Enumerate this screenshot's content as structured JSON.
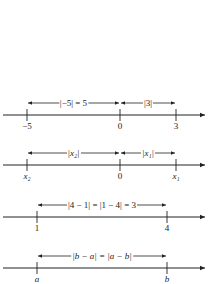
{
  "diagrams": [
    {
      "axis_y": 115,
      "arrow_y": 103,
      "ticks": [
        {
          "x": 27,
          "label": "−5"
        },
        {
          "x": 120,
          "label": "0"
        },
        {
          "x": 176,
          "label": "3"
        }
      ],
      "distances": [
        {
          "x1": 27,
          "x2": 120,
          "label": "|−5| = 5"
        },
        {
          "x1": 120,
          "x2": 176,
          "label": "|3|"
        }
      ]
    },
    {
      "axis_y": 165,
      "arrow_y": 153,
      "ticks": [
        {
          "x": 27,
          "label": "x₂"
        },
        {
          "x": 120,
          "label": "0"
        },
        {
          "x": 176,
          "label": "x₁"
        }
      ],
      "distances": [
        {
          "x1": 27,
          "x2": 120,
          "label": "|x₂|"
        },
        {
          "x1": 120,
          "x2": 176,
          "label": "|x₁|"
        }
      ]
    },
    {
      "axis_y": 217,
      "arrow_y": 205,
      "ticks": [
        {
          "x": 37,
          "label": "1"
        },
        {
          "x": 167,
          "label": "4"
        }
      ],
      "distances": [
        {
          "x1": 37,
          "x2": 167,
          "label": "|4 − 1| = |1 − 4| = 3"
        }
      ]
    },
    {
      "axis_y": 268,
      "arrow_y": 256,
      "ticks": [
        {
          "x": 37,
          "label": "a"
        },
        {
          "x": 167,
          "label": "b"
        }
      ],
      "distances": [
        {
          "x1": 37,
          "x2": 167,
          "label": "|b − a| = |a − b|"
        }
      ]
    }
  ]
}
